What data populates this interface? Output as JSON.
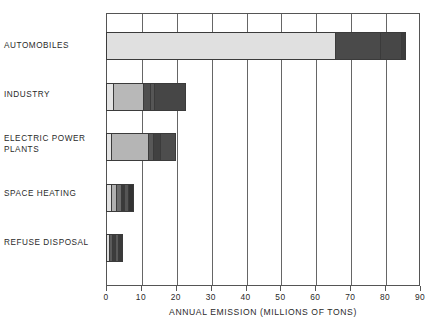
{
  "chart_data": {
    "type": "bar",
    "orientation": "horizontal",
    "stacked": true,
    "title": "",
    "xlabel": "ANNUAL EMISSION (MILLIONS OF TONS)",
    "ylabel": "",
    "xlim": [
      0,
      90
    ],
    "xticks": [
      0,
      10,
      20,
      30,
      40,
      50,
      60,
      70,
      80,
      90
    ],
    "xticklabels": [
      "0",
      "10",
      "20",
      "30",
      "40",
      "50",
      "60",
      "70",
      "80",
      "90"
    ],
    "grid": "vertical",
    "legend": "none",
    "categories": [
      "AUTOMOBILES",
      "INDUSTRY",
      "ELECTRIC POWER\nPLANTS",
      "SPACE HEATING",
      "REFUSE DISPOSAL"
    ],
    "totals": [
      86,
      23,
      20,
      8,
      5
    ],
    "segments": [
      {
        "category": "AUTOMOBILES",
        "total": 86,
        "parts": [
          {
            "value": 66,
            "color": "#e0e0e0"
          },
          {
            "value": 13,
            "color": "#4a4a4a"
          },
          {
            "value": 6,
            "color": "#474747"
          },
          {
            "value": 1,
            "color": "#3d3d3d"
          }
        ]
      },
      {
        "category": "INDUSTRY",
        "total": 23,
        "parts": [
          {
            "value": 2,
            "color": "#e4e4e4"
          },
          {
            "value": 9,
            "color": "#b8b8b8"
          },
          {
            "value": 2,
            "color": "#4f4f4f"
          },
          {
            "value": 1,
            "color": "#565656"
          },
          {
            "value": 9,
            "color": "#464646"
          }
        ]
      },
      {
        "category": "ELECTRIC POWER PLANTS",
        "total": 20,
        "parts": [
          {
            "value": 1.5,
            "color": "#e4e4e4"
          },
          {
            "value": 11,
            "color": "#b5b5b5"
          },
          {
            "value": 1.5,
            "color": "#585858"
          },
          {
            "value": 2,
            "color": "#414141"
          },
          {
            "value": 4,
            "color": "#4d4d4d"
          }
        ]
      },
      {
        "category": "SPACE HEATING",
        "total": 8,
        "parts": [
          {
            "value": 1.5,
            "color": "#e2e2e2"
          },
          {
            "value": 1.5,
            "color": "#b0b0b0"
          },
          {
            "value": 1.5,
            "color": "#6b6b6b"
          },
          {
            "value": 1.2,
            "color": "#3a3a3a"
          },
          {
            "value": 1.1,
            "color": "#555555"
          },
          {
            "value": 1.2,
            "color": "#333333"
          }
        ]
      },
      {
        "category": "REFUSE DISPOSAL",
        "total": 5,
        "parts": [
          {
            "value": 0.9,
            "color": "#dedede"
          },
          {
            "value": 1.0,
            "color": "#5a5a5a"
          },
          {
            "value": 1.0,
            "color": "#3c3c3c"
          },
          {
            "value": 1.0,
            "color": "#595959"
          },
          {
            "value": 1.1,
            "color": "#3a3a3a"
          }
        ]
      }
    ],
    "colors": {
      "frame": "#555555",
      "gridline": "#666666",
      "text": "#2a2a2a",
      "background": "#ffffff"
    }
  },
  "axis": {
    "title": "ANNUAL EMISSION (MILLIONS OF TONS)"
  }
}
